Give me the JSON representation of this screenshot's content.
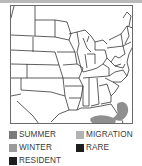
{
  "map": {
    "region": "Eastern United States",
    "range_areas": [
      {
        "category": "WINTER",
        "location": "Atlantic coast east of Florida"
      },
      {
        "category": "WINTER",
        "location": "Florida Keys / southern Gulf of Mexico"
      }
    ]
  },
  "legend": {
    "items": [
      {
        "label": "SUMMER",
        "color": "#7a7a7a"
      },
      {
        "label": "MIGRATION",
        "color": "#b3b3b3"
      },
      {
        "label": "WINTER",
        "color": "#9b9b9b"
      },
      {
        "label": "RARE",
        "color": "#1e1e1e"
      },
      {
        "label": "RESIDENT",
        "color": "#1e1e1e"
      }
    ]
  },
  "colors": {
    "frame": "#6a6a6a",
    "state_lines": "#2a2a2a",
    "range_fill": "#8f8f8f",
    "top_band": "#b9b9b9"
  }
}
